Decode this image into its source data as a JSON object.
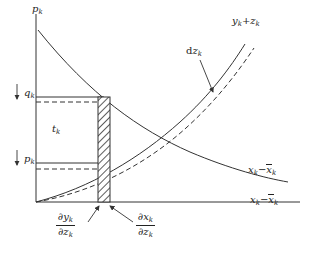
{
  "figure": {
    "type": "economic-diagram",
    "background_color": "#ffffff",
    "line_color": "#333333"
  },
  "axes": {
    "vertical_label": "p",
    "vertical_label_sub": "k",
    "horizontal_label_part1": "x",
    "horizontal_label_sub1": "k",
    "horizontal_label_minus": "−",
    "horizontal_label_part2": "x",
    "horizontal_label_sub2": "k",
    "origin_x": 36,
    "origin_y": 202,
    "x_axis_end": 300,
    "y_axis_top": 14
  },
  "curves": [
    {
      "name": "rising-solid-curve",
      "label_part1": "y",
      "label_sub1": "k",
      "label_op": "+",
      "label_part2": "z",
      "label_sub2": "k",
      "style": "solid",
      "label_x": 232,
      "label_y": 22
    },
    {
      "name": "rising-dashed-curve",
      "style": "dashed",
      "label": ""
    },
    {
      "name": "falling-solid-curve",
      "label_part1": "x",
      "label_sub1": "k",
      "label_minus": "−",
      "label_part2": "x",
      "label_sub2": "k",
      "style": "solid",
      "label_x": 248,
      "label_y": 170
    }
  ],
  "annotations": {
    "dz": {
      "name": "dz-annotation",
      "prefix": "d",
      "symbol": "z",
      "sub": "k",
      "x": 188,
      "y": 52
    },
    "q_level": {
      "name": "q-level-label",
      "arrow": "↓",
      "symbol": "q",
      "sub": "k",
      "x": 13,
      "y": 91,
      "line_y": 97,
      "dashed_y": 102
    },
    "t_block": {
      "name": "t-block-label",
      "symbol": "t",
      "sub": "k",
      "x": 52,
      "y": 127
    },
    "p_level": {
      "name": "p-level-label",
      "arrow": "↓",
      "symbol": "p",
      "sub": "k",
      "x": 13,
      "y": 157,
      "line_y": 163,
      "dashed_y": 169
    },
    "dy_dz": {
      "name": "dy-dz-fraction",
      "numerator_op": "∂",
      "numerator_var": "y",
      "numerator_sub": "k",
      "denominator_op": "∂",
      "denominator_var": "z",
      "denominator_sub": "k",
      "x": 60,
      "y": 212
    },
    "dx_dz": {
      "name": "dx-dz-fraction",
      "numerator_op": "∂",
      "numerator_var": "x",
      "numerator_sub": "k",
      "denominator_op": "∂",
      "denominator_var": "z",
      "denominator_sub": "k",
      "x": 135,
      "y": 212
    }
  },
  "hatched_band": {
    "name": "hatched-band",
    "x_left": 98,
    "x_right": 110,
    "y_top": 97,
    "y_bottom": 202,
    "pattern": "cross-hatch"
  },
  "rectangle": {
    "name": "t-rectangle",
    "x_left": 36,
    "x_right": 98,
    "y_top": 97,
    "y_bottom": 163
  }
}
